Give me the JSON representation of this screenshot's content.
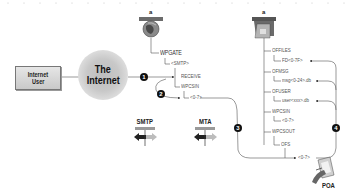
{
  "diagram": {
    "internet_user": {
      "line1": "Internet",
      "line2": "User"
    },
    "internet_cloud": {
      "line1": "The",
      "line2": "Internet"
    },
    "gateway_icon": {
      "letter": "a",
      "name": "globe-gateway-icon"
    },
    "post_office_icon": {
      "letter": "a",
      "name": "post-office-icon"
    },
    "gateway_tree": {
      "root": "WPGATE",
      "child": "<SMTP>",
      "items": [
        {
          "label": "RECEIVE"
        },
        {
          "label": "WPCSIN",
          "sub": "<0-7>"
        }
      ]
    },
    "post_office_tree": {
      "items": [
        {
          "label": "OFFILES",
          "sub": "FD<0-7F>"
        },
        {
          "label": "OFMSG",
          "sub": "msg<0-24>.db"
        },
        {
          "label": "OFUSER",
          "sub": "user<xxx>.db"
        },
        {
          "label": "WPCSIN",
          "sub": "<0-7>"
        },
        {
          "label": "WPCSOUT",
          "sub": "OFS",
          "sub2": "<0-7>"
        }
      ]
    },
    "steps": [
      "1",
      "2",
      "3",
      "4"
    ],
    "protocols": [
      {
        "title": "SMTP"
      },
      {
        "title": "MTA"
      }
    ],
    "poa": {
      "label": "POA"
    },
    "colors": {
      "line": "#555555",
      "badge": "#111111",
      "cloud": "#c4c4c4",
      "box": "#d6d6d6"
    }
  }
}
